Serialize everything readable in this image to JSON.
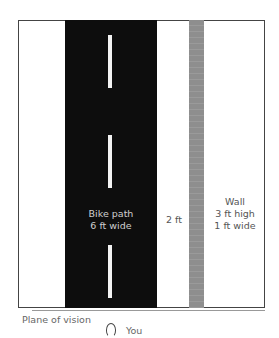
{
  "diagram": {
    "type": "top-down layout",
    "elements": {
      "bike_path": {
        "label_line1": "Bike path",
        "label_line2": "6 ft wide",
        "color": "#0d0d0d"
      },
      "gap": {
        "label": "2 ft"
      },
      "wall": {
        "label_line1": "Wall",
        "label_line2": "3 ft high",
        "label_line3": "1 ft wide",
        "color": "#8e8e8e"
      },
      "plane_of_vision": {
        "label": "Plane of vision"
      },
      "viewer": {
        "label": "You"
      }
    },
    "center_dashes": [
      {
        "top": 35,
        "height": 53
      },
      {
        "top": 135,
        "height": 53
      },
      {
        "top": 245,
        "height": 53
      }
    ]
  }
}
